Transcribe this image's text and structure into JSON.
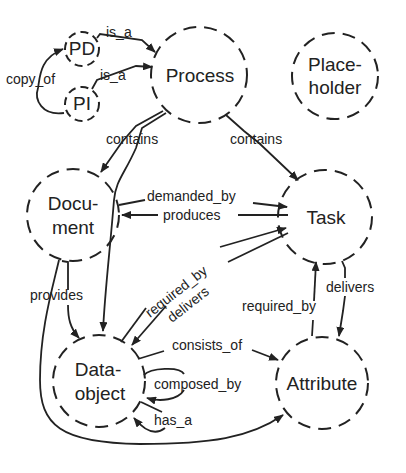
{
  "diagram": {
    "colors": {
      "stroke": "#222222",
      "background": "#ffffff"
    },
    "nodes": {
      "pd": {
        "label": "PD"
      },
      "pi": {
        "label": "PI"
      },
      "process": {
        "label": "Process"
      },
      "placeholder": {
        "line1": "Place-",
        "line2": "holder"
      },
      "document": {
        "line1": "Docu-",
        "line2": "ment"
      },
      "task": {
        "label": "Task"
      },
      "dataobject": {
        "line1": "Data-",
        "line2": "object"
      },
      "attribute": {
        "label": "Attribute"
      }
    },
    "edges": {
      "pd_isa_process": "is_a",
      "pi_isa_process": "is_a",
      "pi_copyof_pd": "copy_of",
      "process_contains_document": "contains",
      "process_contains_task": "contains",
      "document_demandedby_task": "demanded_by",
      "task_produces_document": "produces",
      "dataobject_requiredby_task": "required_by",
      "task_delivers_dataobject": "delivers",
      "document_provides_dataobject": "provides",
      "attribute_requiredby_task": "required_by",
      "task_delivers_attribute": "delivers",
      "dataobject_consistsof_attribute": "consists_of",
      "dataobject_composedby_self": "composed_by",
      "dataobject_hasa_self": "has_a"
    }
  }
}
